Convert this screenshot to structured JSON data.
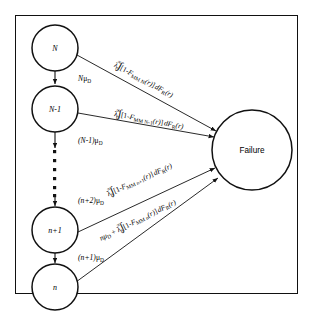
{
  "diagram": {
    "frame_color": "#111111",
    "background": "#ffffff",
    "nodes": [
      {
        "id": "N",
        "label": "N",
        "cx": 55,
        "cy": 48,
        "r": 23
      },
      {
        "id": "N-1",
        "label": "N-1",
        "cx": 55,
        "cy": 109,
        "r": 23
      },
      {
        "id": "n+1",
        "label": "n+1",
        "cx": 55,
        "cy": 230,
        "r": 23
      },
      {
        "id": "n",
        "label": "n",
        "cx": 55,
        "cy": 287,
        "r": 23
      },
      {
        "id": "failure",
        "label": "Failure",
        "cx": 252,
        "cy": 150,
        "r": 40
      }
    ],
    "down_transitions": [
      {
        "from": "N",
        "to": "N-1",
        "rate_main": "N",
        "rate_mu": "μ",
        "rate_sub": "D"
      },
      {
        "from": "N-1",
        "to": "dots",
        "rate_main": "(N-1)",
        "rate_mu": "μ",
        "rate_sub": "D"
      },
      {
        "from": "dots",
        "to": "n+1",
        "rate_main": "(n+2)",
        "rate_mu": "μ",
        "rate_sub": "D"
      },
      {
        "from": "n+1",
        "to": "n",
        "rate_main": "(n+1)",
        "rate_mu": "μ",
        "rate_sub": "D"
      }
    ],
    "failure_transitions": [
      {
        "from": "N",
        "prefix": "",
        "lambda": "λ",
        "integral_lower": "0",
        "integral_upper": "∞",
        "bracket_open": "[1-",
        "fn_name": "F",
        "fn_sub": "MM N",
        "fn_arg": "(r)",
        "bracket_close": "]",
        "measure": "dF",
        "measure_sub": "R",
        "measure_arg": "(r)"
      },
      {
        "from": "N-1",
        "prefix": "",
        "lambda": "λ",
        "integral_lower": "0",
        "integral_upper": "∞",
        "bracket_open": "[1-",
        "fn_name": "F",
        "fn_sub": "MM N-1",
        "fn_arg": "(r)",
        "bracket_close": "]",
        "measure": "dF",
        "measure_sub": "R",
        "measure_arg": "(r)"
      },
      {
        "from": "n+1",
        "prefix": "",
        "lambda": "λ",
        "integral_lower": "0",
        "integral_upper": "∞",
        "bracket_open": "[1-",
        "fn_name": "F",
        "fn_sub": "MM n+1",
        "fn_arg": "(r)",
        "bracket_close": "]",
        "measure": "dF",
        "measure_sub": "R",
        "measure_arg": "(r)"
      },
      {
        "from": "n",
        "prefix": "nμ",
        "prefix_sub": "D",
        "prefix_op": " + ",
        "lambda": "λ",
        "integral_lower": "0",
        "integral_upper": "∞",
        "bracket_open": "[1-",
        "fn_name": "F",
        "fn_sub": "MM n",
        "fn_arg": "(r)",
        "bracket_close": "]",
        "measure": "dF",
        "measure_sub": "R",
        "measure_arg": "(r)"
      }
    ],
    "ellipsis": {
      "dots": 6,
      "x": 55,
      "y_start": 152,
      "y_step": 14
    },
    "integral_glyph": "∫"
  }
}
